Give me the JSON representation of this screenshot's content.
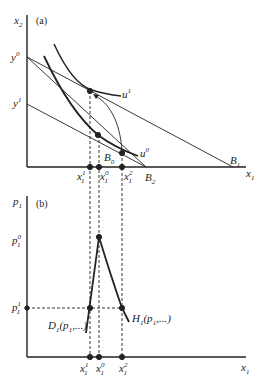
{
  "panel_a": {
    "label": "(a)",
    "y_axis": {
      "var": "x",
      "sub": "2"
    },
    "x_axis": {
      "var": "x",
      "sub": "1"
    },
    "y_ticks": [
      {
        "var": "y",
        "sup": "0"
      },
      {
        "var": "y",
        "sup": "1"
      }
    ],
    "curves": [
      {
        "var": "u",
        "sup": "1"
      },
      {
        "var": "u",
        "sup": "0"
      }
    ],
    "budget_lines": [
      {
        "var": "B",
        "sub": "0"
      },
      {
        "var": "B",
        "sub": "1"
      },
      {
        "var": "B",
        "sub": "2"
      }
    ],
    "x_ticks": [
      {
        "var": "x",
        "sub": "1",
        "sup": "1"
      },
      {
        "var": "x",
        "sub": "1",
        "sup": "0"
      },
      {
        "var": "x",
        "sub": "1",
        "sup": "2"
      }
    ]
  },
  "panel_b": {
    "label": "(b)",
    "y_axis": {
      "var": "p",
      "sub": "1"
    },
    "x_axis": {
      "var": "x",
      "sub": "1"
    },
    "y_ticks": [
      {
        "var": "p",
        "sub": "1",
        "sup": "0"
      },
      {
        "var": "p",
        "sub": "1",
        "sup": "1"
      }
    ],
    "demand_curves": [
      {
        "name": "D",
        "sub": "1",
        "args": "(p",
        "args_sub": "1",
        "args_tail": ",...)"
      },
      {
        "name": "H",
        "sub": "1",
        "args": "(p",
        "args_sub": "1",
        "args_tail": ",...)"
      }
    ],
    "x_ticks": [
      {
        "var": "x",
        "sub": "1",
        "sup": "1"
      },
      {
        "var": "x",
        "sub": "1",
        "sup": "0"
      },
      {
        "var": "x",
        "sub": "1",
        "sup": "2"
      }
    ]
  },
  "colors": {
    "ink": "#222222",
    "background": "#ffffff"
  }
}
